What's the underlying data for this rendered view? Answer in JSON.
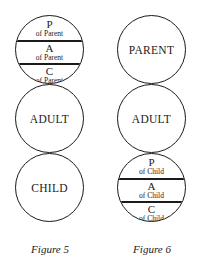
{
  "figures": [
    {
      "caption": "Figure 5",
      "circles": [
        {
          "type": "divided",
          "bands": [
            {
              "letter": "P",
              "sub": "of Parent"
            },
            {
              "letter": "A",
              "sub": "of Parent"
            },
            {
              "letter": "C",
              "sub": "of Parent"
            }
          ]
        },
        {
          "type": "plain",
          "label": "ADULT"
        },
        {
          "type": "plain",
          "label": "CHILD"
        }
      ]
    },
    {
      "caption": "Figure 6",
      "circles": [
        {
          "type": "plain",
          "label": "PARENT"
        },
        {
          "type": "plain",
          "label": "ADULT"
        },
        {
          "type": "divided",
          "bands": [
            {
              "letter": "P",
              "sub": "of Child"
            },
            {
              "letter": "A",
              "sub": "of Child"
            },
            {
              "letter": "C",
              "sub": "of Child"
            }
          ]
        }
      ]
    }
  ]
}
